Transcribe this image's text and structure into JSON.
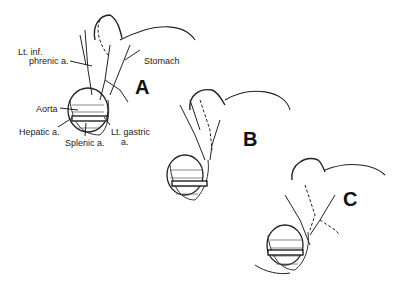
{
  "figure": {
    "panels": [
      {
        "id": "A",
        "label": "A"
      },
      {
        "id": "B",
        "label": "B"
      },
      {
        "id": "C",
        "label": "C"
      }
    ],
    "labels": {
      "lt_inf_phrenic_line1": "Lt. inf.",
      "lt_inf_phrenic_line2": "phrenic a.",
      "stomach": "Stomach",
      "aorta": "Aorta",
      "hepatic": "Hepatic a.",
      "splenic": "Splenic a.",
      "lt_gastric_line1": "Lt. gastric",
      "lt_gastric_line2": "a."
    }
  }
}
